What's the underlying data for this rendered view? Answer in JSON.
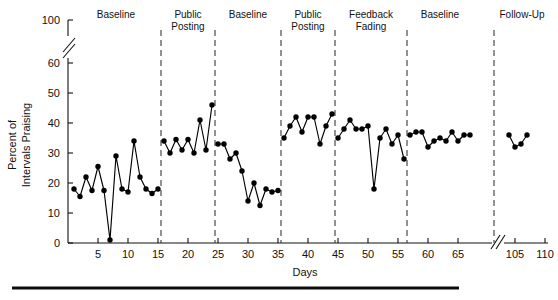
{
  "chart_data": {
    "type": "line",
    "title": "",
    "xlabel": "Days",
    "ylabel": "Percent of Intervals Praising",
    "xlim": [
      0,
      113
    ],
    "ylim": [
      0,
      100
    ],
    "grid": false,
    "legend": null,
    "y_axis_break": {
      "between": [
        60,
        100
      ],
      "present": true
    },
    "x_axis_break": {
      "between": [
        67,
        103
      ],
      "present": true
    },
    "yticks": [
      0,
      10,
      20,
      30,
      40,
      50,
      60,
      100
    ],
    "ytick_labels": [
      "0",
      "10",
      "20",
      "30",
      "40",
      "50",
      "60",
      "100"
    ],
    "xticks": [
      5,
      10,
      15,
      20,
      25,
      30,
      35,
      40,
      45,
      50,
      55,
      60,
      65,
      105,
      110
    ],
    "xtick_labels": [
      "5",
      "10",
      "15",
      "20",
      "25",
      "30",
      "35",
      "40",
      "45",
      "50",
      "55",
      "60",
      "65",
      "105",
      "110"
    ],
    "phases": [
      {
        "label": "Baseline",
        "label_lines": [
          "Baseline"
        ],
        "start_day": 1,
        "end_day": 15
      },
      {
        "label": "Public Posting",
        "label_lines": [
          "Public",
          "Posting"
        ],
        "start_day": 16,
        "end_day": 24
      },
      {
        "label": "Baseline",
        "label_lines": [
          "Baseline"
        ],
        "start_day": 25,
        "end_day": 35
      },
      {
        "label": "Public Posting",
        "label_lines": [
          "Public",
          "Posting"
        ],
        "start_day": 36,
        "end_day": 44
      },
      {
        "label": "Feedback Fading",
        "label_lines": [
          "Feedback",
          "Fading"
        ],
        "start_day": 45,
        "end_day": 56
      },
      {
        "label": "Baseline",
        "label_lines": [
          "Baseline"
        ],
        "start_day": 57,
        "end_day": 67
      },
      {
        "label": "Follow-Up",
        "label_lines": [
          "Follow-Up"
        ],
        "start_day": 104,
        "end_day": 110
      }
    ],
    "phase_dividers_at_day": [
      15.5,
      24.5,
      35.5,
      44.5,
      56.5,
      67.5
    ],
    "series": [
      {
        "name": "Percent of Intervals Praising",
        "segments": [
          {
            "phase": "Baseline",
            "points": [
              [
                1,
                18
              ],
              [
                2,
                15.5
              ],
              [
                3,
                22
              ],
              [
                4,
                17.5
              ],
              [
                5,
                25.5
              ],
              [
                6,
                17.5
              ],
              [
                7,
                1
              ],
              [
                8,
                29
              ],
              [
                9,
                18
              ],
              [
                10,
                17
              ],
              [
                11,
                34
              ],
              [
                12,
                22
              ],
              [
                13,
                18
              ],
              [
                14,
                16.5
              ],
              [
                15,
                18
              ]
            ]
          },
          {
            "phase": "Public Posting",
            "points": [
              [
                16,
                34
              ],
              [
                17,
                30
              ],
              [
                18,
                34.5
              ],
              [
                19,
                31
              ],
              [
                20,
                34.5
              ],
              [
                21,
                30
              ],
              [
                22,
                41
              ],
              [
                23,
                31
              ],
              [
                24,
                46
              ]
            ]
          },
          {
            "phase": "Baseline",
            "points": [
              [
                25,
                33
              ],
              [
                26,
                33
              ],
              [
                27,
                28
              ],
              [
                28,
                30
              ],
              [
                29,
                24
              ],
              [
                30,
                14
              ],
              [
                31,
                20
              ],
              [
                32,
                12.5
              ],
              [
                33,
                18
              ],
              [
                34,
                17
              ],
              [
                35,
                17.5
              ]
            ]
          },
          {
            "phase": "Public Posting",
            "points": [
              [
                36,
                35
              ],
              [
                37,
                39
              ],
              [
                38,
                42
              ],
              [
                39,
                37
              ],
              [
                40,
                42
              ],
              [
                41,
                42
              ],
              [
                42,
                33
              ],
              [
                43,
                39
              ],
              [
                44,
                43
              ]
            ]
          },
          {
            "phase": "Feedback Fading",
            "points": [
              [
                45,
                35
              ],
              [
                46,
                38
              ],
              [
                47,
                41
              ],
              [
                48,
                38
              ],
              [
                49,
                38
              ],
              [
                50,
                39
              ],
              [
                51,
                18
              ],
              [
                52,
                35
              ],
              [
                53,
                38
              ],
              [
                54,
                33
              ],
              [
                55,
                36
              ],
              [
                56,
                28
              ]
            ]
          },
          {
            "phase": "Baseline",
            "points": [
              [
                57,
                36
              ],
              [
                58,
                37
              ],
              [
                59,
                37
              ],
              [
                60,
                32
              ],
              [
                61,
                34
              ],
              [
                62,
                35
              ],
              [
                63,
                34
              ],
              [
                64,
                37
              ],
              [
                65,
                34
              ],
              [
                66,
                36
              ],
              [
                67,
                36
              ]
            ]
          },
          {
            "phase": "Follow-Up",
            "points": [
              [
                104,
                36
              ],
              [
                105,
                32
              ],
              [
                106,
                33
              ],
              [
                107,
                36
              ]
            ]
          }
        ]
      }
    ]
  },
  "figure": {
    "x_axis_title": "Days",
    "y_axis_title_lines": [
      "Percent of",
      "Intervals Praising"
    ]
  }
}
